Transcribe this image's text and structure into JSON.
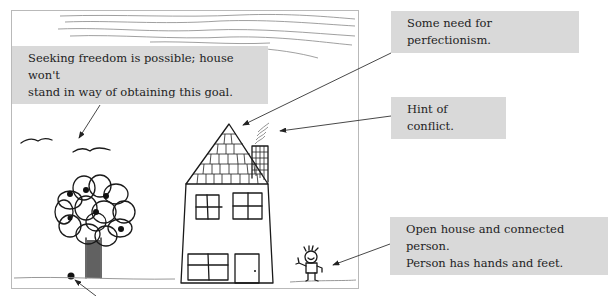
{
  "figure": {
    "drawing_elements": [
      "sky-scribbles",
      "birds",
      "tree",
      "fallen-fruit",
      "house",
      "roof-tiles",
      "chimney-smoke",
      "windows",
      "door",
      "person",
      "ground-line"
    ]
  },
  "annotations": [
    {
      "id": "freedom",
      "lines": [
        "Seeking freedom is possible; house won't",
        "stand in way of obtaining this goal."
      ],
      "points_to": "birds"
    },
    {
      "id": "perfectionism",
      "lines": [
        "Some need for perfectionism."
      ],
      "points_to": "roof"
    },
    {
      "id": "conflict",
      "lines": [
        "Hint of conflict."
      ],
      "points_to": "chimney-smoke"
    },
    {
      "id": "open-house",
      "lines": [
        "Open house and connected person.",
        "Person has hands and feet."
      ],
      "points_to": "person"
    }
  ],
  "colors": {
    "callout_bg": "#d9d9d9",
    "text": "#1e1e1e",
    "ink": "#1a1a1a",
    "frame_border": "#b9b9b9"
  }
}
